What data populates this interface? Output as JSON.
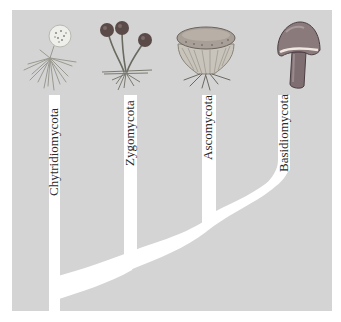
{
  "diagram": {
    "type": "phylogenetic-tree",
    "colors": {
      "background": "#ffffff",
      "panel": "#d4d4d4",
      "branch": "#ffffff",
      "label_text": "#2a2a2a",
      "zygo_sporangium": "#5a4a48",
      "basidio_cap": "#8a7a7c",
      "asco_cup": "#a8a098",
      "chytrid_sporangium": "#eeeeee"
    },
    "taxa": [
      {
        "name": "Chytridiomycota",
        "illustration": "chytrid-sporangium-with-rhizoids"
      },
      {
        "name": "Zygomycota",
        "illustration": "bread-mold-sporangiophores"
      },
      {
        "name": "Ascomycota",
        "illustration": "cup-fungus-ascocarp"
      },
      {
        "name": "Basidiomycota",
        "illustration": "mushroom-basidiocarp"
      }
    ],
    "topology": "(Chytridiomycota,(Zygomycota,(Ascomycota,Basidiomycota)))"
  }
}
